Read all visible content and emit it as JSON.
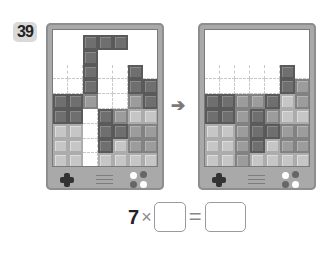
{
  "problem": {
    "number": "39"
  },
  "devices": [
    {
      "id": "before",
      "left": 46,
      "grid": [
        [
          ".",
          ".",
          "d",
          "d",
          "d",
          ".",
          "."
        ],
        [
          ".",
          ".",
          "d",
          ".",
          ".",
          ".",
          "."
        ],
        [
          ".",
          ".",
          "d",
          ".",
          ".",
          "d",
          "."
        ],
        [
          ".",
          ".",
          "d",
          ".",
          ".",
          "d",
          "d"
        ],
        [
          "d",
          "d",
          "m",
          ".",
          ".",
          "m",
          "d"
        ],
        [
          "d",
          "d",
          ".",
          "d",
          "m",
          "l",
          "l"
        ],
        [
          "l",
          "l",
          ".",
          "d",
          "d",
          "m",
          "m"
        ],
        [
          "l",
          "l",
          ".",
          "d",
          "l",
          "m",
          "m"
        ],
        [
          "l",
          "l",
          ".",
          "l",
          "l",
          "l",
          "l"
        ]
      ]
    },
    {
      "id": "after",
      "left": 198,
      "grid": [
        [
          ".",
          ".",
          ".",
          ".",
          ".",
          ".",
          "."
        ],
        [
          ".",
          ".",
          ".",
          ".",
          ".",
          ".",
          "."
        ],
        [
          ".",
          ".",
          ".",
          ".",
          ".",
          "d",
          "."
        ],
        [
          ".",
          ".",
          ".",
          ".",
          ".",
          "d",
          "m"
        ],
        [
          "d",
          "d",
          "m",
          "m",
          "d",
          "l",
          "m"
        ],
        [
          "d",
          "d",
          "m",
          "d",
          "m",
          "l",
          "l"
        ],
        [
          "l",
          "l",
          "m",
          "d",
          "d",
          "m",
          "m"
        ],
        [
          "l",
          "l",
          "m",
          "d",
          "l",
          "m",
          "m"
        ],
        [
          "l",
          "l",
          "m",
          "l",
          "l",
          "l",
          "l"
        ]
      ]
    }
  ],
  "arrow": "➔",
  "equation": {
    "multiplicand": "7",
    "times": "×",
    "equals": "=",
    "blank1": "",
    "blank2": ""
  },
  "colors": {
    "dark": "#6f6f6f",
    "medium": "#9c9c9c",
    "light": "#c6c6c6",
    "frame": "#a9a9a9"
  }
}
